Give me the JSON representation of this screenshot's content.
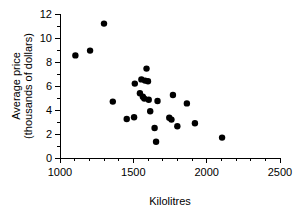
{
  "chart_data": {
    "type": "scatter",
    "title": "",
    "subtitle": "",
    "xlabel": "Kilolitres",
    "ylabel": "Average price\n(thousands of dollars)",
    "ylabel_line1": "Average price",
    "ylabel_line2": "(thousands of dollars)",
    "xlim": [
      1000,
      2500
    ],
    "ylim": [
      0,
      12
    ],
    "x_major_ticks": [
      1000,
      1500,
      2000,
      2500
    ],
    "x_major_tick_labels": [
      "1000",
      "1500",
      "2000",
      "2500"
    ],
    "x_minor_tick_step": 100,
    "y_major_ticks": [
      0,
      2,
      4,
      6,
      8,
      10,
      12
    ],
    "y_major_tick_labels": [
      "0",
      "2",
      "4",
      "6",
      "8",
      "10",
      "12"
    ],
    "y_minor_tick_step": 1,
    "grid": false,
    "legend": null,
    "legend_position": "none",
    "marker": "filled-circle",
    "marker_color": "#000000",
    "marker_size_px": 4.2,
    "series": [
      {
        "name": "Average price vs kilolitres",
        "points": [
          [
            1105,
            8.55
          ],
          [
            1205,
            8.95
          ],
          [
            1300,
            11.2
          ],
          [
            1360,
            4.7
          ],
          [
            1455,
            3.25
          ],
          [
            1505,
            3.4
          ],
          [
            1510,
            6.2
          ],
          [
            1545,
            5.4
          ],
          [
            1555,
            6.55
          ],
          [
            1565,
            5.1
          ],
          [
            1575,
            4.95
          ],
          [
            1580,
            6.45
          ],
          [
            1590,
            7.45
          ],
          [
            1600,
            6.4
          ],
          [
            1605,
            4.85
          ],
          [
            1615,
            3.9
          ],
          [
            1645,
            2.5
          ],
          [
            1655,
            1.35
          ],
          [
            1665,
            4.75
          ],
          [
            1745,
            3.35
          ],
          [
            1760,
            3.2
          ],
          [
            1770,
            5.25
          ],
          [
            1800,
            2.65
          ],
          [
            1865,
            4.55
          ],
          [
            1920,
            2.9
          ],
          [
            2105,
            1.7
          ]
        ]
      }
    ]
  },
  "axes": {
    "x_axis_name": "x-axis",
    "y_axis_name": "y-axis"
  }
}
